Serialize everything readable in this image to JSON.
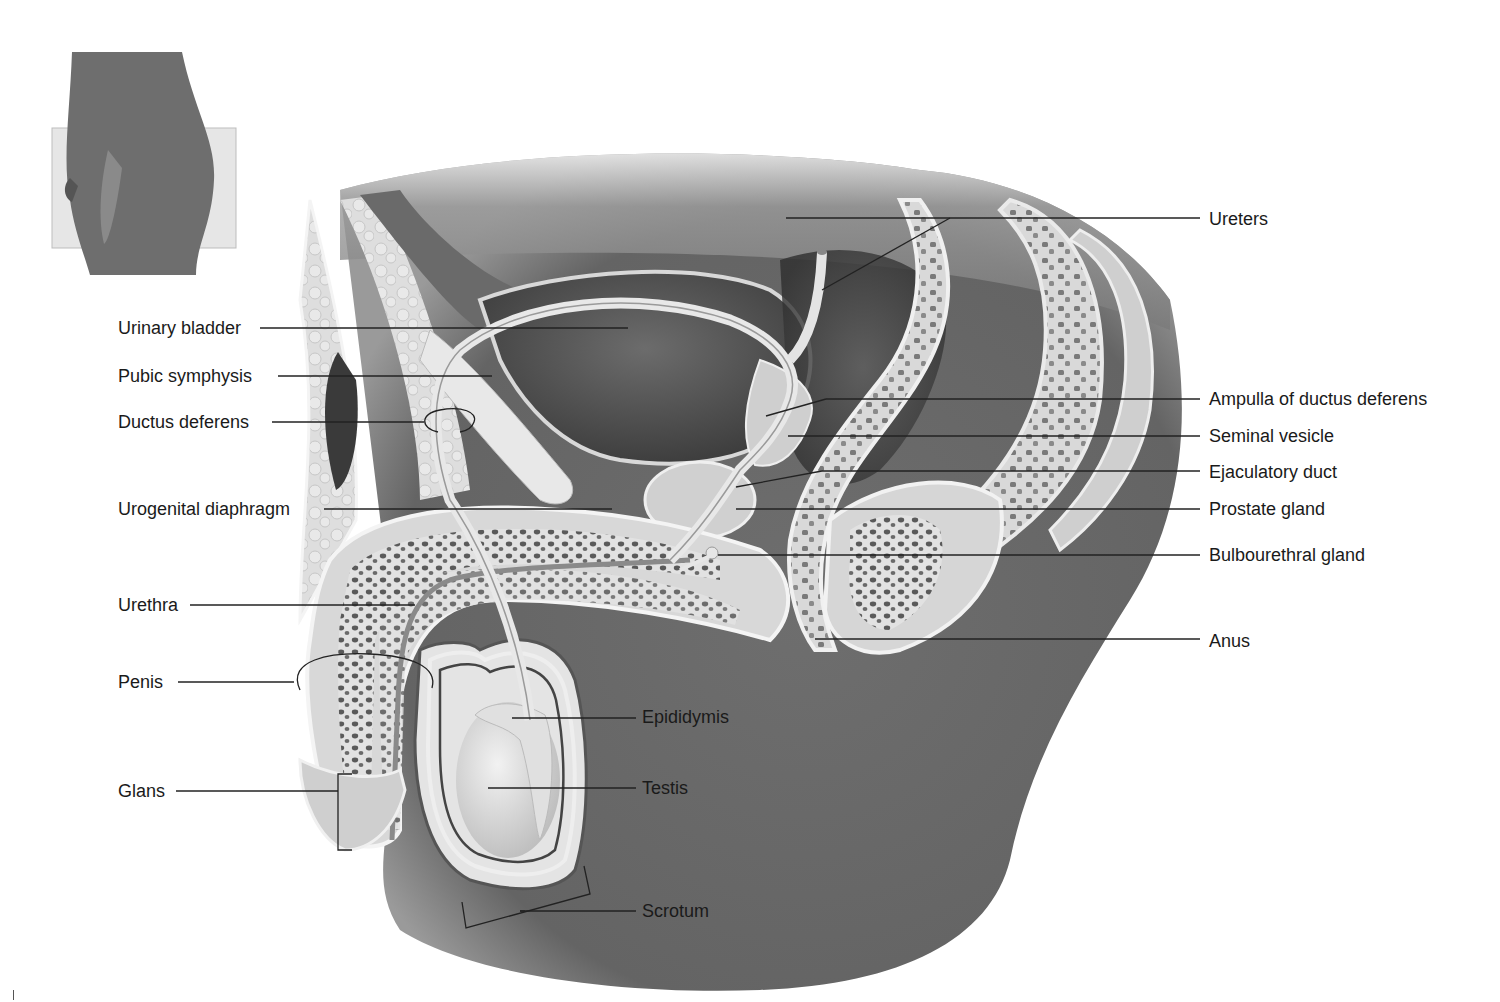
{
  "figure": {
    "inset": {
      "description": "Orientation thumbnail: lateral view of male lower torso with sectioning plane"
    },
    "colors": {
      "background": "#ffffff",
      "text": "#1a1a1a",
      "leader_line": "#222222",
      "tissue_dark": "#5a5a5a",
      "tissue_mid": "#8c8c8c",
      "tissue_light": "#d4d4d4",
      "tissue_pale": "#ececec"
    }
  },
  "labels": {
    "left": [
      {
        "id": "urinary-bladder",
        "text": "Urinary bladder",
        "x": 118,
        "y": 318,
        "line": [
          [
            260,
            328
          ],
          [
            628,
            328
          ]
        ]
      },
      {
        "id": "pubic-symphysis",
        "text": "Pubic symphysis",
        "x": 118,
        "y": 366,
        "line": [
          [
            278,
            376
          ],
          [
            492,
            376
          ]
        ]
      },
      {
        "id": "ductus-deferens",
        "text": "Ductus deferens",
        "x": 118,
        "y": 412,
        "line": [
          [
            272,
            422
          ],
          [
            424,
            422
          ]
        ]
      },
      {
        "id": "urogenital-diaphragm",
        "text": "Urogenital diaphragm",
        "x": 118,
        "y": 499,
        "line": [
          [
            324,
            509
          ],
          [
            612,
            509
          ]
        ]
      },
      {
        "id": "urethra",
        "text": "Urethra",
        "x": 118,
        "y": 595,
        "line": [
          [
            190,
            605
          ],
          [
            415,
            605
          ]
        ]
      },
      {
        "id": "penis",
        "text": "Penis",
        "x": 118,
        "y": 672,
        "line": [
          [
            178,
            682
          ],
          [
            294,
            682
          ]
        ]
      },
      {
        "id": "glans",
        "text": "Glans",
        "x": 118,
        "y": 781,
        "line": [
          [
            176,
            791
          ],
          [
            338,
            791
          ]
        ]
      }
    ],
    "right": [
      {
        "id": "ureters",
        "text": "Ureters",
        "x": 1209,
        "y": 209,
        "line": [
          [
            786,
            218
          ],
          [
            1200,
            218
          ]
        ]
      },
      {
        "id": "ampulla-of-ductus-deferens",
        "text": "Ampulla of ductus deferens",
        "x": 1209,
        "y": 389,
        "line": [
          [
            826,
            399
          ],
          [
            1200,
            399
          ]
        ]
      },
      {
        "id": "seminal-vesicle",
        "text": "Seminal vesicle",
        "x": 1209,
        "y": 426,
        "line": [
          [
            788,
            436
          ],
          [
            1200,
            436
          ]
        ]
      },
      {
        "id": "ejaculatory-duct",
        "text": "Ejaculatory duct",
        "x": 1209,
        "y": 462,
        "line": [
          [
            822,
            471
          ],
          [
            1200,
            471
          ]
        ]
      },
      {
        "id": "prostate-gland",
        "text": "Prostate gland",
        "x": 1209,
        "y": 499,
        "line": [
          [
            736,
            509
          ],
          [
            1200,
            509
          ]
        ]
      },
      {
        "id": "bulbourethral-gland",
        "text": "Bulbourethral gland",
        "x": 1209,
        "y": 545,
        "line": [
          [
            718,
            555
          ],
          [
            1200,
            555
          ]
        ]
      },
      {
        "id": "anus",
        "text": "Anus",
        "x": 1209,
        "y": 631,
        "line": [
          [
            815,
            639
          ],
          [
            1200,
            639
          ]
        ]
      }
    ],
    "center": [
      {
        "id": "epididymis",
        "text": "Epididymis",
        "x": 642,
        "y": 707,
        "line": [
          [
            512,
            718
          ],
          [
            636,
            718
          ]
        ]
      },
      {
        "id": "testis",
        "text": "Testis",
        "x": 642,
        "y": 778,
        "line": [
          [
            488,
            788
          ],
          [
            636,
            788
          ]
        ]
      },
      {
        "id": "scrotum",
        "text": "Scrotum",
        "x": 642,
        "y": 901,
        "line": [
          [
            520,
            911
          ],
          [
            636,
            911
          ]
        ]
      }
    ]
  }
}
